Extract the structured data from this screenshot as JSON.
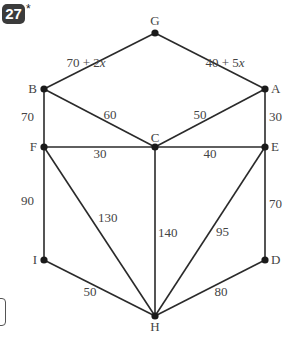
{
  "problem": {
    "number": "27",
    "marker": "*"
  },
  "graph": {
    "nodes": [
      {
        "id": "G",
        "x": 155,
        "y": 33,
        "lx": 155,
        "ly": 25,
        "anchor": "middle"
      },
      {
        "id": "B",
        "x": 44,
        "y": 89,
        "lx": 37,
        "ly": 93,
        "anchor": "end"
      },
      {
        "id": "A",
        "x": 265,
        "y": 89,
        "lx": 271,
        "ly": 93,
        "anchor": "start"
      },
      {
        "id": "F",
        "x": 44,
        "y": 147,
        "lx": 37,
        "ly": 151,
        "anchor": "end"
      },
      {
        "id": "C",
        "x": 155,
        "y": 147,
        "lx": 155,
        "ly": 142,
        "anchor": "middle"
      },
      {
        "id": "E",
        "x": 265,
        "y": 147,
        "lx": 271,
        "ly": 151,
        "anchor": "start"
      },
      {
        "id": "I",
        "x": 44,
        "y": 260,
        "lx": 37,
        "ly": 264,
        "anchor": "end"
      },
      {
        "id": "D",
        "x": 265,
        "y": 260,
        "lx": 271,
        "ly": 264,
        "anchor": "start"
      },
      {
        "id": "H",
        "x": 155,
        "y": 316,
        "lx": 155,
        "ly": 331,
        "anchor": "middle"
      }
    ],
    "edges": [
      {
        "from": "G",
        "to": "B",
        "weight": "70 + 2x",
        "lx": 86,
        "ly": 67,
        "anchor": "middle"
      },
      {
        "from": "G",
        "to": "A",
        "weight": "40 + 5x",
        "lx": 225,
        "ly": 67,
        "anchor": "middle"
      },
      {
        "from": "B",
        "to": "C",
        "weight": "60",
        "lx": 110,
        "ly": 119,
        "anchor": "middle"
      },
      {
        "from": "A",
        "to": "C",
        "weight": "50",
        "lx": 200,
        "ly": 119,
        "anchor": "middle"
      },
      {
        "from": "B",
        "to": "F",
        "weight": "70",
        "lx": 34,
        "ly": 121,
        "anchor": "end"
      },
      {
        "from": "A",
        "to": "E",
        "weight": "30",
        "lx": 269,
        "ly": 121,
        "anchor": "start"
      },
      {
        "from": "F",
        "to": "C",
        "weight": "30",
        "lx": 100,
        "ly": 158,
        "anchor": "middle"
      },
      {
        "from": "C",
        "to": "E",
        "weight": "40",
        "lx": 210,
        "ly": 158,
        "anchor": "middle"
      },
      {
        "from": "F",
        "to": "I",
        "weight": "90",
        "lx": 34,
        "ly": 205,
        "anchor": "end"
      },
      {
        "from": "F",
        "to": "H",
        "weight": "130",
        "lx": 98,
        "ly": 222,
        "anchor": "start"
      },
      {
        "from": "C",
        "to": "H",
        "weight": "140",
        "lx": 158,
        "ly": 237,
        "anchor": "start"
      },
      {
        "from": "E",
        "to": "H",
        "weight": "95",
        "lx": 216,
        "ly": 236,
        "anchor": "start"
      },
      {
        "from": "E",
        "to": "D",
        "weight": "70",
        "lx": 269,
        "ly": 208,
        "anchor": "start"
      },
      {
        "from": "I",
        "to": "H",
        "weight": "50",
        "lx": 90,
        "ly": 296,
        "anchor": "middle"
      },
      {
        "from": "D",
        "to": "H",
        "weight": "80",
        "lx": 221,
        "ly": 296,
        "anchor": "middle"
      }
    ]
  },
  "style": {
    "line_color": "#2a2a2a",
    "node_color": "#1a1a1a",
    "label_color": "#444444"
  }
}
